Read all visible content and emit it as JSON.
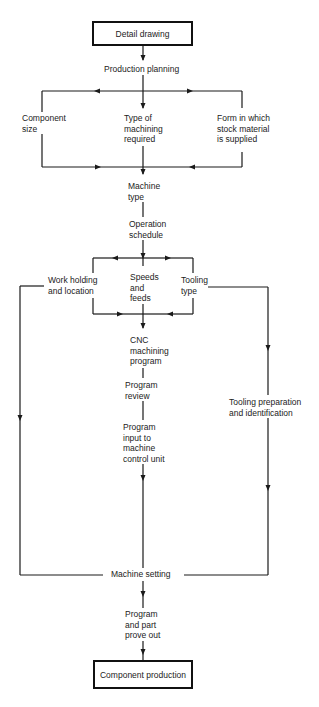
{
  "diagram": {
    "type": "flowchart",
    "line_color": "#1a1a1a",
    "start_node": "Detail drawing",
    "end_node": "Component production",
    "nodes": {
      "detail_drawing": "Detail drawing",
      "production_planning": "Production planning",
      "component_size": "Component\nsize",
      "type_of_machining": "Type of\nmachining\nrequired",
      "form_of_stock": "Form in which\nstock material\nis supplied",
      "machine_type": "Machine\ntype",
      "operation_schedule": "Operation\nschedule",
      "work_holding": "Work holding\nand location",
      "speeds_feeds": "Speeds\nand\nfeeds",
      "tooling_type": "Tooling\ntype",
      "cnc_program": "CNC\nmachining\nprogram",
      "program_review": "Program\nreview",
      "program_input": "Program\ninput to\nmachine\ncontrol unit",
      "tooling_preparation": "Tooling preparation\nand identification",
      "machine_setting": "Machine setting",
      "prove_out": "Program\nand part\nprove out",
      "component_production": "Component production"
    },
    "edges": [
      [
        "Detail drawing",
        "Production planning"
      ],
      [
        "Production planning",
        "Component size"
      ],
      [
        "Production planning",
        "Type of machining required"
      ],
      [
        "Production planning",
        "Form in which stock material is supplied"
      ],
      [
        "Component size",
        "Machine type"
      ],
      [
        "Type of machining required",
        "Machine type"
      ],
      [
        "Form in which stock material is supplied",
        "Machine type"
      ],
      [
        "Machine type",
        "Operation schedule"
      ],
      [
        "Operation schedule",
        "Work holding and location"
      ],
      [
        "Operation schedule",
        "Speeds and feeds"
      ],
      [
        "Operation schedule",
        "Tooling type"
      ],
      [
        "Work holding and location",
        "CNC machining program"
      ],
      [
        "Speeds and feeds",
        "CNC machining program"
      ],
      [
        "Tooling type",
        "CNC machining program"
      ],
      [
        "Work holding and location",
        "Machine setting"
      ],
      [
        "Tooling type",
        "Tooling preparation and identification"
      ],
      [
        "Tooling preparation and identification",
        "Machine setting"
      ],
      [
        "CNC machining program",
        "Program review"
      ],
      [
        "Program review",
        "Program input to machine control unit"
      ],
      [
        "Program input to machine control unit",
        "Machine setting"
      ],
      [
        "Machine setting",
        "Program and part prove out"
      ],
      [
        "Program and part prove out",
        "Component production"
      ]
    ]
  }
}
